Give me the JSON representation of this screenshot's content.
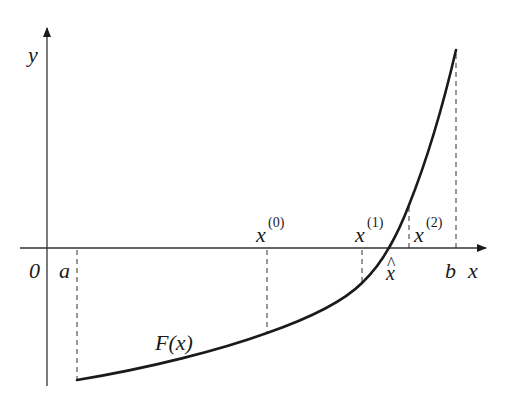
{
  "diagram": {
    "type": "newton-iteration-plot",
    "axes": {
      "x_label": "x",
      "y_label": "y",
      "origin_label": "0"
    },
    "points": {
      "a": "a",
      "b": "b",
      "root": "x",
      "root_hat": "^"
    },
    "iterates": [
      {
        "base": "x",
        "sup": "(0)"
      },
      {
        "base": "x",
        "sup": "(1)"
      },
      {
        "base": "x",
        "sup": "(2)"
      }
    ],
    "curve_label": "F(x)",
    "colors": {
      "line": "#1a1a1a",
      "background": "#ffffff"
    }
  }
}
